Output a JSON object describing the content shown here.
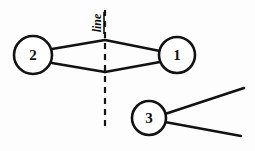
{
  "diagram": {
    "title": "line",
    "background_color": "#fdfdfd",
    "ink_color": "#121212",
    "width": 255,
    "height": 151,
    "reference_line": {
      "label": "line",
      "orientation": "vertical",
      "style": "dashed",
      "x": 105,
      "y_start": 10,
      "y_end": 131,
      "label_x": 97,
      "label_y": 23,
      "label_rotation": -90
    },
    "nodes": [
      {
        "id": "node-1",
        "label": "1",
        "cx": 177,
        "cy": 55,
        "r": 18
      },
      {
        "id": "node-2",
        "label": "2",
        "cx": 33,
        "cy": 55,
        "r": 19
      },
      {
        "id": "node-3",
        "label": "3",
        "cx": 149,
        "cy": 118,
        "r": 17
      }
    ],
    "rays": [
      {
        "id": "ray-upper-left",
        "from_node": "node-2",
        "to_node": "node-1",
        "x1": 52,
        "y1": 49,
        "x2": 105,
        "y2": 40
      },
      {
        "id": "ray-upper-right",
        "from_node": "node-2",
        "to_node": "node-1",
        "x1": 105,
        "y1": 40,
        "x2": 160,
        "y2": 51
      },
      {
        "id": "ray-lower-left",
        "from_node": "node-2",
        "to_node": "node-1",
        "x1": 52,
        "y1": 63,
        "x2": 105,
        "y2": 72
      },
      {
        "id": "ray-lower-right",
        "from_node": "node-2",
        "to_node": "node-1",
        "x1": 105,
        "y1": 72,
        "x2": 160,
        "y2": 62
      },
      {
        "id": "ray-node3-upper",
        "from_node": "node-3",
        "to_node": "",
        "x1": 165,
        "y1": 114,
        "x2": 244,
        "y2": 88
      },
      {
        "id": "ray-node3-lower",
        "from_node": "node-3",
        "to_node": "",
        "x1": 165,
        "y1": 122,
        "x2": 241,
        "y2": 136
      }
    ]
  }
}
